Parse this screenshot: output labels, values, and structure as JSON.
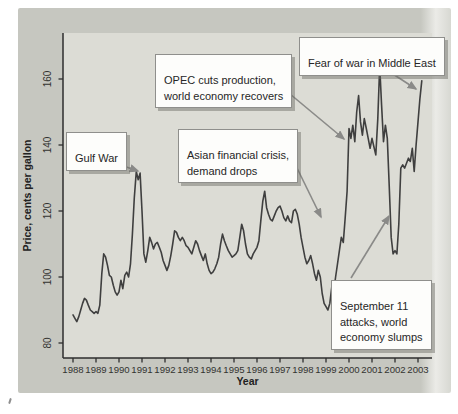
{
  "figure": {
    "y_axis_label": "Price, cents per gallon",
    "x_axis_label": "Year"
  },
  "colors": {
    "panel_bg": "#c6c7c0",
    "panel_edge_light": "#ebebe7",
    "plot_bg": "#dcdcd5",
    "line": "#3f3f3f",
    "spine": "#2e2e2e",
    "tick_text": "#333330",
    "arrow": "#8a8a88",
    "box_bg": "#fdfdfb",
    "box_border": "#8f8f8c"
  },
  "chart_data": {
    "type": "line",
    "title": "",
    "xlabel": "Year",
    "ylabel": "Price, cents per gallon",
    "grid": false,
    "x_range": [
      "1988-01",
      "2003-03"
    ],
    "x_tick_labels": [
      "1988",
      "1989",
      "1990",
      "1991",
      "1992",
      "1993",
      "1994",
      "1995",
      "1996",
      "1997",
      "1998",
      "1999",
      "2000",
      "2001",
      "2002",
      "2003"
    ],
    "y_ticks": [
      80,
      100,
      120,
      140,
      160
    ],
    "ylim": [
      75,
      174
    ],
    "series": [
      {
        "name": "gasoline-retail-price-cents-per-gallon",
        "frequency": "monthly",
        "start": "1988-01",
        "values": [
          88.5,
          87.5,
          86.5,
          88,
          90,
          92,
          93.5,
          93,
          91.5,
          90,
          89.5,
          89,
          89.5,
          89,
          91.5,
          101,
          107,
          106,
          103.5,
          100.5,
          100,
          97.5,
          95.5,
          94.5,
          95.5,
          99,
          96.5,
          100.5,
          101.5,
          100,
          104,
          113,
          124,
          132,
          129.5,
          131.5,
          120,
          107,
          104.5,
          108,
          112,
          110.5,
          108.5,
          110,
          110.5,
          109,
          107.5,
          105,
          103.5,
          102,
          103.5,
          106.5,
          110,
          114,
          113.5,
          112,
          111,
          112,
          111,
          109.5,
          109,
          108,
          107,
          109,
          111,
          110,
          108,
          106.5,
          105,
          107,
          104,
          102,
          101,
          101.5,
          102.5,
          104,
          106,
          110,
          113,
          111,
          109.5,
          108,
          107,
          106,
          106.5,
          107,
          108,
          112,
          116,
          114,
          110,
          107,
          106,
          105.5,
          107,
          108,
          109,
          111,
          117,
          123,
          126,
          121,
          119,
          117.5,
          117,
          118.5,
          120,
          121,
          121.5,
          120,
          118,
          117,
          118.5,
          117,
          116.5,
          120,
          120.5,
          119,
          116,
          112,
          109,
          106,
          104,
          105,
          106.5,
          104,
          101,
          99,
          102,
          100,
          95,
          92,
          91,
          90,
          92,
          97,
          95.5,
          100,
          104,
          108,
          112,
          110.5,
          118,
          126,
          145,
          142,
          146,
          141,
          150,
          155,
          147,
          143,
          148,
          145,
          142,
          139,
          142,
          139.5,
          137,
          148,
          164,
          152,
          141,
          146,
          142,
          127,
          112,
          107,
          108,
          107,
          116,
          133,
          134,
          133,
          134.5,
          136,
          135,
          139,
          132,
          140,
          147,
          154,
          159.5
        ]
      }
    ],
    "annotations": [
      {
        "id": "gulf-war",
        "text": "Gulf War",
        "arrow_target": {
          "year": 1990.8,
          "value": 132
        }
      },
      {
        "id": "opec",
        "text": "OPEC cuts production,\nworld economy recovers",
        "arrow_target": {
          "year": 2000.0,
          "value": 144
        }
      },
      {
        "id": "asian-crisis",
        "text": "Asian financial crisis,\ndemand drops",
        "arrow_target": {
          "year": 1998.7,
          "value": 118
        }
      },
      {
        "id": "sept-11",
        "text": "September 11\nattacks, world\neconomy slumps",
        "arrow_target": {
          "year": 2001.8,
          "value": 119
        }
      },
      {
        "id": "fear-war",
        "text": "Fear of war in Middle East",
        "arrow_target": {
          "year": 2003.2,
          "value": 159.5
        }
      }
    ]
  }
}
